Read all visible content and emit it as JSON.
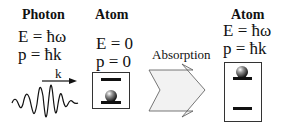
{
  "photon": {
    "heading": "Photon",
    "energy": "E = ħω",
    "momentum": "p = ħk",
    "wave_label": "k"
  },
  "atom_initial": {
    "heading": "Atom",
    "energy": "E = 0",
    "momentum": "p = 0",
    "state": "ground"
  },
  "process": {
    "label": "Absorption",
    "arrow_fill": "#f2f2f2"
  },
  "atom_final": {
    "heading": "Atom",
    "energy": "E = ħω",
    "momentum": "p = ħk",
    "state": "excited"
  }
}
